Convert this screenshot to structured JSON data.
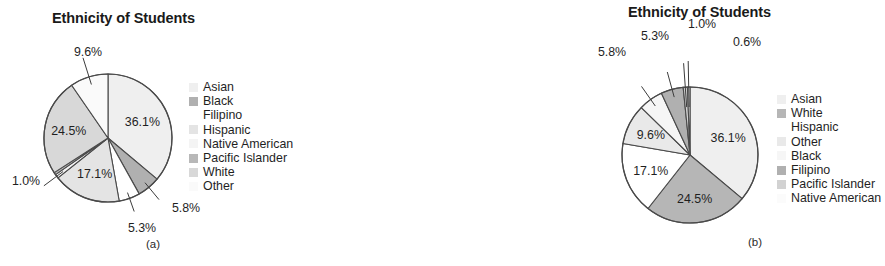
{
  "figures": [
    {
      "id": "a",
      "caption": "(a)",
      "title": "Ethnicity of Students",
      "legend": [
        {
          "label": "Asian",
          "color": "#efefef"
        },
        {
          "label": "Black",
          "color": "#b0b0b0"
        },
        {
          "label": "Filipino",
          "color": "#ffffff"
        },
        {
          "label": "Hispanic",
          "color": "#e4e4e4"
        },
        {
          "label": "Native American",
          "color": "#f4f4f4"
        },
        {
          "label": "Pacific Islander",
          "color": "#b8b8b8"
        },
        {
          "label": "White",
          "color": "#d8d8d8"
        },
        {
          "label": "Other",
          "color": "#fafafa"
        }
      ],
      "chart_data": {
        "type": "pie",
        "title": "Ethnicity of Students",
        "legend_position": "right",
        "order": "category",
        "categories": [
          "Asian",
          "Black",
          "Filipino",
          "Hispanic",
          "Native American",
          "Pacific Islander",
          "White",
          "Other"
        ],
        "values": [
          36.1,
          5.8,
          5.3,
          17.1,
          1.0,
          0.6,
          24.5,
          9.6
        ],
        "labels": [
          "36.1%",
          "5.8%",
          "5.3%",
          "17.1%",
          "1.0%",
          "0.6%",
          "24.5%",
          "9.6%"
        ],
        "colors": [
          "#efefef",
          "#b0b0b0",
          "#ffffff",
          "#e4e4e4",
          "#f4f4f4",
          "#b8b8b8",
          "#d8d8d8",
          "#fafafa"
        ],
        "label_placement": [
          "inside",
          "outside",
          "outside",
          "inside",
          "outside",
          "outside",
          "inside",
          "outside"
        ],
        "units": "percent",
        "total": 100.0
      }
    },
    {
      "id": "b",
      "caption": "(b)",
      "title": "Ethnicity of Students",
      "legend": [
        {
          "label": "Asian",
          "color": "#efefef"
        },
        {
          "label": "White",
          "color": "#b6b6b6"
        },
        {
          "label": "Hispanic",
          "color": "#ffffff"
        },
        {
          "label": "Other",
          "color": "#e9e9e9"
        },
        {
          "label": "Black",
          "color": "#f6f6f6"
        },
        {
          "label": "Filipino",
          "color": "#b0b0b0"
        },
        {
          "label": "Pacific Islander",
          "color": "#d2d2d2"
        },
        {
          "label": "Native American",
          "color": "#fbfbfb"
        }
      ],
      "chart_data": {
        "type": "pie",
        "title": "Ethnicity of Students",
        "legend_position": "right",
        "order": "descending",
        "categories": [
          "Asian",
          "White",
          "Hispanic",
          "Other",
          "Black",
          "Filipino",
          "Pacific Islander",
          "Native American"
        ],
        "values": [
          36.1,
          24.5,
          17.1,
          9.6,
          5.8,
          5.3,
          1.0,
          0.6
        ],
        "labels": [
          "36.1%",
          "24.5%",
          "17.1%",
          "9.6%",
          "5.8%",
          "5.3%",
          "1.0%",
          "0.6%"
        ],
        "colors": [
          "#efefef",
          "#b6b6b6",
          "#ffffff",
          "#e9e9e9",
          "#f6f6f6",
          "#b0b0b0",
          "#d2d2d2",
          "#fbfbfb"
        ],
        "label_placement": [
          "inside",
          "inside",
          "inside",
          "inside",
          "outside",
          "outside",
          "outside",
          "outside"
        ],
        "units": "percent",
        "total": 100.0
      }
    }
  ],
  "geometry": {
    "pie_a": {
      "cx": 108,
      "cy": 138,
      "r": 64
    },
    "pie_b": {
      "cx": 100,
      "cy": 155,
      "r": 68
    }
  },
  "style": {
    "stroke": "#4a4a4a",
    "leader_stroke": "#3c3c3c",
    "text": "#1f1f1f"
  }
}
